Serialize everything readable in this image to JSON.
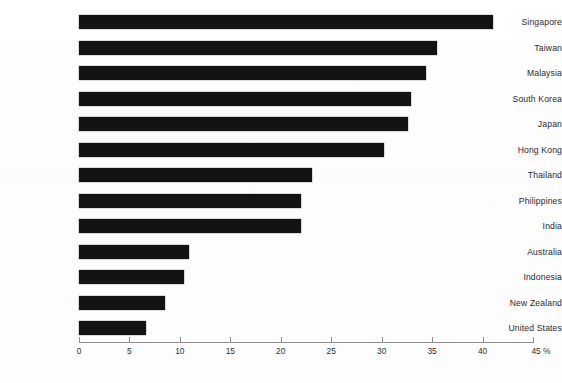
{
  "chart_data": {
    "type": "bar",
    "orientation": "horizontal",
    "title": "",
    "subtitle": "",
    "xlabel": "",
    "ylabel": "",
    "xlim": [
      0,
      45
    ],
    "unit": "%",
    "grid": false,
    "legend": null,
    "categories": [
      "Singapore",
      "Taiwan",
      "Malaysia",
      "South Korea",
      "Japan",
      "Hong Kong",
      "Thailand",
      "Philippines",
      "India",
      "Australia",
      "Indonesia",
      "New Zealand",
      "United States"
    ],
    "values": [
      41.0,
      35.5,
      34.4,
      32.9,
      32.6,
      30.2,
      23.1,
      22.0,
      22.0,
      10.9,
      10.4,
      8.5,
      6.6
    ],
    "xticks": [
      0,
      5,
      10,
      15,
      20,
      25,
      30,
      35,
      40,
      45
    ],
    "xtick_labels": [
      "0",
      "5",
      "10",
      "15",
      "20",
      "25",
      "30",
      "35",
      "40",
      "45 %"
    ],
    "bar_color": "#131313",
    "axis_color": "#8d8d8d",
    "background_color": "#fdfdfd"
  }
}
